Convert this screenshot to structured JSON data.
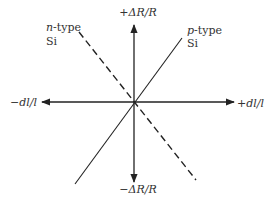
{
  "diagram": {
    "type": "strain-gauge-resistance-change",
    "colors": {
      "background": "#ffffff",
      "line": "#222222",
      "text": "#333333"
    },
    "axes": {
      "vertical_positive": {
        "sign": "+",
        "symbol": "ΔR/R",
        "label": "+ΔR/R"
      },
      "vertical_negative": {
        "sign": "−",
        "symbol": "ΔR/R",
        "label": "−ΔR/R"
      },
      "horizontal_positive": {
        "sign": "+",
        "symbol": "dl/l",
        "label": "+dl/l"
      },
      "horizontal_negative": {
        "sign": "−",
        "symbol": "dl/l",
        "label": "−dl/l"
      }
    },
    "lines": [
      {
        "id": "n-type",
        "style": "dashed",
        "prefix": "n",
        "suffix": "-type",
        "material": "Si",
        "slope": "negative"
      },
      {
        "id": "p-type",
        "style": "solid",
        "prefix": "p",
        "suffix": "-type",
        "material": "Si",
        "slope": "positive"
      }
    ]
  }
}
